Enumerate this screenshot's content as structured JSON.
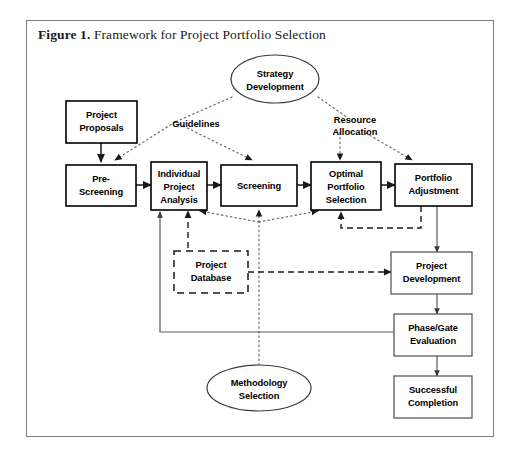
{
  "figure": {
    "label": "Figure 1.",
    "title": "Framework for Project Portfolio Selection"
  },
  "nodes": {
    "project_proposals": {
      "line1": "Project",
      "line2": "Proposals"
    },
    "strategy_development": {
      "line1": "Strategy",
      "line2": "Development"
    },
    "pre_screening": {
      "line1": "Pre-",
      "line2": "Screening"
    },
    "individual_project_analysis": {
      "line1": "Individual",
      "line2": "Project",
      "line3": "Analysis"
    },
    "screening": {
      "line1": "Screening"
    },
    "optimal_portfolio_selection": {
      "line1": "Optimal",
      "line2": "Portfolio",
      "line3": "Selection"
    },
    "portfolio_adjustment": {
      "line1": "Portfolio",
      "line2": "Adjustment"
    },
    "project_database": {
      "line1": "Project",
      "line2": "Database"
    },
    "project_development": {
      "line1": "Project",
      "line2": "Development"
    },
    "phase_gate_evaluation": {
      "line1": "Phase/Gate",
      "line2": "Evaluation"
    },
    "successful_completion": {
      "line1": "Successful",
      "line2": "Completion"
    },
    "methodology_selection": {
      "line1": "Methodology",
      "line2": "Selection"
    }
  },
  "annotations": {
    "guidelines": "Guidelines",
    "resource_allocation_l1": "Resource",
    "resource_allocation_l2": "Allocation"
  },
  "colors": {
    "frame_border": "#7d7d7d",
    "box_border": "#000000",
    "text": "#000000",
    "dotted": "#767676",
    "background": "#ffffff"
  }
}
